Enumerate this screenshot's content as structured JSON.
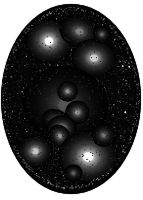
{
  "image": {
    "kind": "astronomical-plate",
    "subject": "galaxy cluster field",
    "caption": "",
    "width": 143,
    "height": 200,
    "background_color": "#ffffff",
    "sky_color": "#050505",
    "aperture": {
      "shape": "ellipse",
      "center_x": 71,
      "center_y": 99,
      "radius_x": 70,
      "radius_y": 95
    }
  },
  "chart_data": {
    "type": "scatter",
    "title": "",
    "xlabel": "",
    "ylabel": "",
    "xlim": [
      0,
      143
    ],
    "ylim": [
      0,
      200
    ],
    "grid": false,
    "legend": "none",
    "note": "Pixel positions, core radius and peak brightness of resolved objects on the plate; brightness is 0-1 normalized grey level.",
    "galaxies": [
      {
        "id": "g1",
        "name": "upper-left-bright-elliptical",
        "x": 49,
        "y": 39,
        "radius": 7.5,
        "brightness": 1.0,
        "elongation": 1.05,
        "angle": 0
      },
      {
        "id": "g2",
        "name": "upper-right-diffuse",
        "x": 80,
        "y": 29,
        "radius": 5.5,
        "brightness": 0.52,
        "elongation": 1.25,
        "angle": 25
      },
      {
        "id": "g3",
        "name": "right-upper-elliptical",
        "x": 95,
        "y": 57,
        "radius": 6.5,
        "brightness": 0.82,
        "elongation": 1.15,
        "angle": 10
      },
      {
        "id": "g4",
        "name": "core-dominant-left",
        "x": 60,
        "y": 104,
        "radius": 6.0,
        "brightness": 0.86,
        "elongation": 1.2,
        "angle": 15
      },
      {
        "id": "g5",
        "name": "core-dominant-right",
        "x": 71,
        "y": 101,
        "radius": 5.5,
        "brightness": 0.9,
        "elongation": 1.05,
        "angle": 0
      },
      {
        "id": "g6",
        "name": "core-halo-diffuse",
        "x": 66,
        "y": 106,
        "radius": 13.0,
        "brightness": 0.34,
        "elongation": 1.1,
        "angle": 20
      },
      {
        "id": "g7",
        "name": "core-south-companion",
        "x": 78,
        "y": 114,
        "radius": 4.0,
        "brightness": 0.62,
        "elongation": 1.0,
        "angle": 0
      },
      {
        "id": "g8",
        "name": "core-north-companion",
        "x": 68,
        "y": 92,
        "radius": 3.5,
        "brightness": 0.58,
        "elongation": 1.0,
        "angle": 0
      },
      {
        "id": "g9",
        "name": "chain-upper",
        "x": 57,
        "y": 124,
        "radius": 4.0,
        "brightness": 0.56,
        "elongation": 1.3,
        "angle": 35
      },
      {
        "id": "g10",
        "name": "chain-middle",
        "x": 62,
        "y": 131,
        "radius": 4.5,
        "brightness": 0.74,
        "elongation": 1.1,
        "angle": 0
      },
      {
        "id": "g11",
        "name": "chain-lower",
        "x": 60,
        "y": 139,
        "radius": 3.5,
        "brightness": 0.6,
        "elongation": 1.15,
        "angle": 60
      },
      {
        "id": "g12",
        "name": "left-lower-elliptical",
        "x": 35,
        "y": 155,
        "radius": 5.5,
        "brightness": 0.78,
        "elongation": 1.05,
        "angle": 0
      },
      {
        "id": "g13",
        "name": "lower-right-brightest",
        "x": 89,
        "y": 161,
        "radius": 9.0,
        "brightness": 1.0,
        "elongation": 1.1,
        "angle": 5
      },
      {
        "id": "g14",
        "name": "right-lower-faint",
        "x": 105,
        "y": 138,
        "radius": 4.0,
        "brightness": 0.46,
        "elongation": 1.0,
        "angle": 0
      },
      {
        "id": "g15",
        "name": "upper-right-faint-knot",
        "x": 103,
        "y": 32,
        "radius": 3.0,
        "brightness": 0.4,
        "elongation": 1.0,
        "angle": 0
      },
      {
        "id": "g16",
        "name": "south-field-faint",
        "x": 74,
        "y": 178,
        "radius": 3.0,
        "brightness": 0.38,
        "elongation": 1.0,
        "angle": 0
      }
    ],
    "star_count": 1400,
    "speckle_count": 900
  }
}
